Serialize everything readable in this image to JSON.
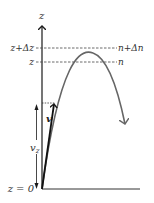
{
  "diagram": {
    "type": "projectile-trajectory",
    "axis": {
      "label": "z"
    },
    "levels": [
      {
        "left_label": "z+Δz",
        "right_label": "n+Δn"
      },
      {
        "left_label": "z",
        "right_label": "n"
      }
    ],
    "origin_label": "z = 0",
    "velocity_label": "v",
    "vertical_component_label": "v",
    "vertical_component_subscript": "z",
    "colors": {
      "axis": "#1a1a1a",
      "trajectory": "#666666",
      "dashed": "#444444",
      "text": "#333333"
    }
  }
}
